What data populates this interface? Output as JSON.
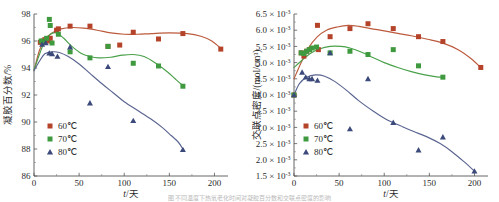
{
  "figure": {
    "caption_fragment": "图 不同温度下热氧老化时间对凝胶百分数和交联点密度的影响"
  },
  "colors": {
    "series_60": "#b5432a",
    "series_60_line": "#bb5a3c",
    "series_70": "#3f9a3f",
    "series_70_line": "#4aa14a",
    "series_80": "#3b4a7a",
    "series_80_line": "#5a6490",
    "axis": "#555555",
    "text": "#2b2b2b"
  },
  "legend": {
    "items": [
      {
        "label": "60℃",
        "marker": "square",
        "color_key": "series_60"
      },
      {
        "label": "70℃",
        "marker": "square",
        "color_key": "series_70"
      },
      {
        "label": "80℃",
        "marker": "triangle",
        "color_key": "series_80"
      }
    ]
  },
  "chart_data": [
    {
      "id": "gel-fraction",
      "type": "scatter",
      "title": "",
      "xlabel": "t/天",
      "ylabel": "凝胶百分数/%",
      "xlim": [
        0,
        215
      ],
      "ylim": [
        86,
        98
      ],
      "xticks": [
        0,
        50,
        100,
        150,
        200
      ],
      "xticklabels": [
        "0",
        "50",
        "100",
        "150",
        "200"
      ],
      "yticks": [
        86,
        88,
        90,
        92,
        94,
        96,
        98
      ],
      "yticklabels": [
        "86",
        "88",
        "90",
        "92",
        "94",
        "96",
        "98"
      ],
      "grid": false,
      "legend_position": "lower-left",
      "series": [
        {
          "name": "60℃",
          "color_key": "series_60",
          "marker": "square",
          "points": [
            [
              7,
              95.9
            ],
            [
              10,
              96.0
            ],
            [
              12,
              96.1
            ],
            [
              16,
              96.0
            ],
            [
              18,
              96.2
            ],
            [
              25,
              96.8
            ],
            [
              27,
              96.9
            ],
            [
              40,
              97.1
            ],
            [
              62,
              97.1
            ],
            [
              82,
              95.6
            ],
            [
              95,
              95.7
            ],
            [
              110,
              96.65
            ],
            [
              138,
              96.15
            ],
            [
              165,
              96.55
            ],
            [
              207,
              95.4
            ]
          ],
          "fit_curve": [
            [
              0,
              93.8
            ],
            [
              6,
              95.3
            ],
            [
              12,
              96.1
            ],
            [
              20,
              96.6
            ],
            [
              30,
              96.9
            ],
            [
              42,
              97.0
            ],
            [
              55,
              96.95
            ],
            [
              70,
              96.8
            ],
            [
              85,
              96.6
            ],
            [
              100,
              96.5
            ],
            [
              115,
              96.5
            ],
            [
              130,
              96.55
            ],
            [
              150,
              96.6
            ],
            [
              170,
              96.55
            ],
            [
              185,
              96.35
            ],
            [
              197,
              96.0
            ],
            [
              207,
              95.45
            ]
          ]
        },
        {
          "name": "70℃",
          "color_key": "series_70",
          "marker": "square",
          "points": [
            [
              8,
              96.0
            ],
            [
              11,
              95.9
            ],
            [
              14,
              96.2
            ],
            [
              17,
              97.6
            ],
            [
              18,
              97.15
            ],
            [
              20,
              95.85
            ],
            [
              27,
              96.5
            ],
            [
              40,
              95.2
            ],
            [
              62,
              94.75
            ],
            [
              82,
              95.6
            ],
            [
              110,
              94.35
            ],
            [
              138,
              94.15
            ],
            [
              165,
              92.65
            ]
          ],
          "fit_curve": [
            [
              0,
              93.85
            ],
            [
              6,
              95.0
            ],
            [
              12,
              96.0
            ],
            [
              18,
              96.5
            ],
            [
              25,
              96.6
            ],
            [
              33,
              96.2
            ],
            [
              42,
              95.6
            ],
            [
              52,
              95.1
            ],
            [
              62,
              94.85
            ],
            [
              72,
              94.75
            ],
            [
              85,
              94.8
            ],
            [
              98,
              94.95
            ],
            [
              110,
              95.0
            ],
            [
              122,
              94.85
            ],
            [
              135,
              94.35
            ],
            [
              148,
              93.7
            ],
            [
              158,
              93.1
            ],
            [
              165,
              92.7
            ]
          ]
        },
        {
          "name": "80℃",
          "color_key": "series_80",
          "marker": "triangle",
          "points": [
            [
              9,
              95.75
            ],
            [
              13,
              95.85
            ],
            [
              17,
              95.1
            ],
            [
              20,
              95.05
            ],
            [
              26,
              94.85
            ],
            [
              40,
              95.55
            ],
            [
              62,
              91.4
            ],
            [
              82,
              94.1
            ],
            [
              110,
              90.1
            ],
            [
              165,
              87.95
            ]
          ],
          "fit_curve": [
            [
              0,
              93.8
            ],
            [
              6,
              94.5
            ],
            [
              12,
              95.05
            ],
            [
              20,
              95.2
            ],
            [
              28,
              95.15
            ],
            [
              38,
              94.85
            ],
            [
              50,
              94.3
            ],
            [
              62,
              93.6
            ],
            [
              75,
              92.85
            ],
            [
              88,
              92.15
            ],
            [
              100,
              91.5
            ],
            [
              115,
              90.85
            ],
            [
              130,
              90.2
            ],
            [
              142,
              89.6
            ],
            [
              152,
              89.0
            ],
            [
              160,
              88.5
            ],
            [
              165,
              88.0
            ]
          ]
        }
      ]
    },
    {
      "id": "crosslink-density",
      "type": "scatter",
      "title": "",
      "xlabel": "t/天",
      "ylabel": "交联点密度/(mol/cm³)",
      "xlim": [
        0,
        215
      ],
      "ylim": [
        1.5,
        6.5
      ],
      "y_scale_factor": "×10⁻³",
      "xticks": [
        0,
        50,
        100,
        150,
        200
      ],
      "xticklabels": [
        "0",
        "50",
        "100",
        "150",
        "200"
      ],
      "yticks": [
        1.5,
        2.0,
        2.5,
        3.0,
        3.5,
        4.0,
        4.5,
        5.0,
        5.5,
        6.0,
        6.5
      ],
      "yticklabels": [
        "1.5 × 10-3",
        "2.0 × 10-3",
        "2.5 × 10-3",
        "3.0 × 10-3",
        "3.5 × 10-3",
        "4.0 × 10-3",
        "4.5 × 10-3",
        "5.0 × 10-3",
        "5.5 × 10-3",
        "6.0 × 10-3",
        "6.5 × 10-3"
      ],
      "grid": false,
      "legend_position": "lower-left",
      "series": [
        {
          "name": "60℃",
          "color_key": "series_60",
          "marker": "square",
          "points": [
            [
              0,
              4.0
            ],
            [
              8,
              5.3
            ],
            [
              11,
              5.2
            ],
            [
              14,
              5.35
            ],
            [
              17,
              5.4
            ],
            [
              26,
              6.15
            ],
            [
              27,
              5.4
            ],
            [
              40,
              5.8
            ],
            [
              62,
              6.05
            ],
            [
              82,
              6.2
            ],
            [
              110,
              6.05
            ],
            [
              138,
              5.8
            ],
            [
              165,
              5.65
            ],
            [
              207,
              4.85
            ]
          ],
          "fit_curve": [
            [
              0,
              4.5
            ],
            [
              8,
              5.0
            ],
            [
              16,
              5.45
            ],
            [
              26,
              5.8
            ],
            [
              36,
              6.0
            ],
            [
              48,
              6.1
            ],
            [
              60,
              6.15
            ],
            [
              72,
              6.12
            ],
            [
              85,
              6.05
            ],
            [
              100,
              5.98
            ],
            [
              115,
              5.9
            ],
            [
              130,
              5.83
            ],
            [
              148,
              5.72
            ],
            [
              165,
              5.6
            ],
            [
              182,
              5.4
            ],
            [
              195,
              5.15
            ],
            [
              207,
              4.85
            ]
          ]
        },
        {
          "name": "70℃",
          "color_key": "series_70",
          "marker": "square",
          "points": [
            [
              0,
              4.0
            ],
            [
              8,
              5.3
            ],
            [
              11,
              5.28
            ],
            [
              14,
              5.35
            ],
            [
              17,
              5.4
            ],
            [
              20,
              5.45
            ],
            [
              25,
              5.48
            ],
            [
              40,
              5.3
            ],
            [
              62,
              5.35
            ],
            [
              82,
              5.25
            ],
            [
              110,
              5.4
            ],
            [
              138,
              4.9
            ],
            [
              165,
              4.55
            ]
          ],
          "fit_curve": [
            [
              0,
              4.85
            ],
            [
              8,
              5.05
            ],
            [
              18,
              5.28
            ],
            [
              28,
              5.42
            ],
            [
              40,
              5.5
            ],
            [
              52,
              5.5
            ],
            [
              62,
              5.45
            ],
            [
              75,
              5.32
            ],
            [
              88,
              5.15
            ],
            [
              100,
              5.0
            ],
            [
              115,
              4.85
            ],
            [
              130,
              4.72
            ],
            [
              145,
              4.62
            ],
            [
              158,
              4.56
            ],
            [
              165,
              4.55
            ]
          ]
        },
        {
          "name": "80℃",
          "color_key": "series_80",
          "marker": "triangle",
          "points": [
            [
              0,
              4.0
            ],
            [
              9,
              4.7
            ],
            [
              13,
              4.55
            ],
            [
              17,
              4.5
            ],
            [
              20,
              4.5
            ],
            [
              26,
              4.45
            ],
            [
              40,
              5.3
            ],
            [
              62,
              2.95
            ],
            [
              82,
              4.5
            ],
            [
              110,
              3.15
            ],
            [
              138,
              2.3
            ],
            [
              165,
              2.7
            ],
            [
              200,
              1.65
            ]
          ],
          "fit_curve": [
            [
              0,
              4.0
            ],
            [
              6,
              4.35
            ],
            [
              14,
              4.55
            ],
            [
              24,
              4.62
            ],
            [
              34,
              4.58
            ],
            [
              45,
              4.42
            ],
            [
              58,
              4.15
            ],
            [
              72,
              3.82
            ],
            [
              88,
              3.5
            ],
            [
              102,
              3.25
            ],
            [
              118,
              3.05
            ],
            [
              132,
              2.88
            ],
            [
              148,
              2.7
            ],
            [
              162,
              2.5
            ],
            [
              175,
              2.25
            ],
            [
              188,
              1.95
            ],
            [
              200,
              1.65
            ]
          ]
        }
      ]
    }
  ]
}
